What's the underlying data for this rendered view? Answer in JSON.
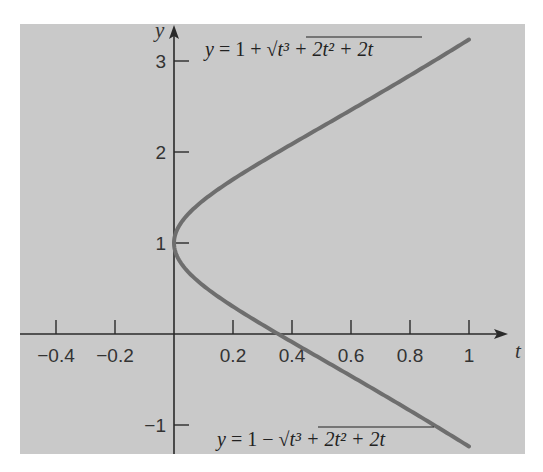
{
  "chart_data": {
    "type": "line",
    "title": "",
    "xlabel": "t",
    "ylabel": "y",
    "xlim": [
      -0.5,
      1.1
    ],
    "ylim": [
      -1.25,
      3.45
    ],
    "grid": false,
    "legend": null,
    "x_ticks": [
      -0.4,
      -0.2,
      0.2,
      0.4,
      0.6,
      0.8,
      1
    ],
    "x_tick_labels": [
      "−0.4",
      "−0.2",
      "0.2",
      "0.4",
      "0.6",
      "0.8",
      "1"
    ],
    "y_ticks": [
      -1,
      1,
      2,
      3
    ],
    "y_tick_labels": [
      "−1",
      "1",
      "2",
      "3"
    ],
    "series": [
      {
        "name": "upper branch",
        "label": "y = 1 + √(t³ + 2t² + 2t)",
        "label_position": "top",
        "t": [
          0,
          0.05,
          0.1,
          0.2,
          0.3,
          0.4,
          0.5,
          0.6,
          0.7,
          0.8,
          0.9,
          1.0
        ],
        "y": [
          1.0,
          1.32,
          1.46,
          1.66,
          1.83,
          1.98,
          2.12,
          2.25,
          2.38,
          2.51,
          2.64,
          3.24
        ]
      },
      {
        "name": "lower branch",
        "label": "y = 1 − √(t³ + 2t² + 2t)",
        "label_position": "bottom",
        "t": [
          0,
          0.05,
          0.1,
          0.2,
          0.3,
          0.4,
          0.5,
          0.6,
          0.7,
          0.8,
          0.9,
          1.0
        ],
        "y": [
          1.0,
          0.68,
          0.54,
          0.34,
          0.17,
          0.02,
          -0.12,
          -0.25,
          -0.38,
          -0.51,
          -0.64,
          -1.24
        ]
      }
    ],
    "annotations": [
      {
        "text": "y = 1 + √(t³ + 2t² + 2t)",
        "near": "upper-right curve"
      },
      {
        "text": "y = 1 − √(t³ + 2t² + 2t)",
        "near": "lower-right curve"
      }
    ],
    "colors": {
      "background": "#c8c8c8",
      "curve": "#6e6e6e",
      "axes": "#2a2a2a"
    }
  },
  "axes": {
    "x_var": "t",
    "y_var": "y"
  },
  "equations": {
    "upper": {
      "lhs": "y",
      "eq": " = 1 + ",
      "rad": "t³ + 2t² + 2t"
    },
    "lower": {
      "lhs": "y",
      "eq": " = 1 − ",
      "rad": "t³ + 2t² + 2t"
    }
  }
}
